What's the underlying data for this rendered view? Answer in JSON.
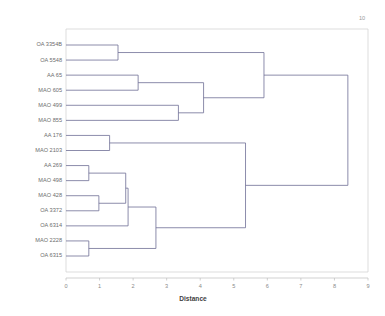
{
  "chart_data": {
    "type": "dendrogram",
    "title": "",
    "xlabel": "Distance",
    "ylabel": "",
    "xlim": [
      0,
      9
    ],
    "xticks": [
      0,
      1,
      2,
      3,
      4,
      5,
      6,
      7,
      8,
      9
    ],
    "xtick_labels": [
      "0",
      "1",
      "2",
      "3",
      "4",
      "5",
      "6",
      "7",
      "8",
      "9"
    ],
    "grid": false,
    "legend": false,
    "corner_annotation": "10",
    "orientation": "left",
    "line_color": "#6f6f96",
    "leaf_labels": [
      "OA 3354B",
      "OA 5548",
      "AA 65",
      "MAO 605",
      "MAO 499",
      "MAO 855",
      "AA 176",
      "MAO 2103",
      "AA 269",
      "MAO 498",
      "MAO 428",
      "OA 3372",
      "OA 6314",
      "MAO 2228",
      "OA 6315"
    ],
    "merges": [
      {
        "id": "m1",
        "left": "OA 3354B",
        "right": "OA 5548",
        "distance": 1.55
      },
      {
        "id": "m2",
        "left": "AA 65",
        "right": "MAO 605",
        "distance": 2.15
      },
      {
        "id": "m3",
        "left": "MAO 499",
        "right": "MAO 855",
        "distance": 3.35
      },
      {
        "id": "m4",
        "left": "m2",
        "right": "m3",
        "distance": 4.1
      },
      {
        "id": "m5",
        "left": "m1",
        "right": "m4",
        "distance": 5.9
      },
      {
        "id": "m6",
        "left": "AA 176",
        "right": "MAO 2103",
        "distance": 1.3
      },
      {
        "id": "m7",
        "left": "AA 269",
        "right": "MAO 498",
        "distance": 0.68
      },
      {
        "id": "m8",
        "left": "MAO 428",
        "right": "OA 3372",
        "distance": 0.98
      },
      {
        "id": "m9",
        "left": "m7",
        "right": "m8",
        "distance": 1.78
      },
      {
        "id": "m10",
        "left": "m9",
        "right": "OA 6314",
        "distance": 1.85
      },
      {
        "id": "m11",
        "left": "MAO 2228",
        "right": "OA 6315",
        "distance": 0.68
      },
      {
        "id": "m12",
        "left": "m10",
        "right": "m11",
        "distance": 2.68
      },
      {
        "id": "m13",
        "left": "m6",
        "right": "m12",
        "distance": 5.35
      },
      {
        "id": "m14",
        "left": "m5",
        "right": "m13",
        "distance": 8.4
      }
    ]
  }
}
